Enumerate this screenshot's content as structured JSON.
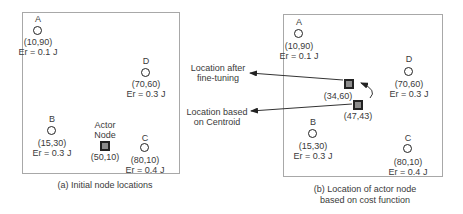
{
  "panel_a": {
    "caption": "(a) Initial node locations",
    "nodes": [
      {
        "name": "A",
        "coord": "(10,90)",
        "energy": "Er = 0.1 J"
      },
      {
        "name": "D",
        "coord": "(70,60)",
        "energy": "Er = 0.3 J"
      },
      {
        "name": "B",
        "coord": "(15,30)",
        "energy": "Er = 0.3 J"
      },
      {
        "name": "C",
        "coord": "(80,10)",
        "energy": "Er = 0.4 J"
      }
    ],
    "actor": {
      "label_line1": "Actor",
      "label_line2": "Node",
      "coord": "(50,10)"
    }
  },
  "panel_b": {
    "caption_line1": "(b) Location of actor node",
    "caption_line2": "based on cost function",
    "nodes": [
      {
        "name": "A",
        "coord": "(10,90)",
        "energy": "Er = 0.1 J"
      },
      {
        "name": "D",
        "coord": "(70,60)",
        "energy": "Er = 0.3 J"
      },
      {
        "name": "B",
        "coord": "(15,30)",
        "energy": "Er = 0.3 J"
      },
      {
        "name": "C",
        "coord": "(80,10)",
        "energy": "Er = 0.4 J"
      }
    ],
    "actor_finetuned": {
      "coord": "(34,60)"
    },
    "actor_centroid": {
      "coord": "(47,43)"
    }
  },
  "annotations": {
    "finetune_line1": "Location after",
    "finetune_line2": "fine-tuning",
    "centroid_line1": "Location based",
    "centroid_line2": "on Centroid"
  }
}
